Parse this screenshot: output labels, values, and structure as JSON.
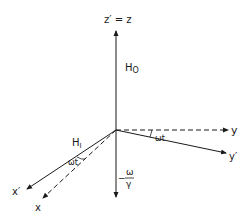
{
  "diagram": {
    "axes": {
      "z": {
        "label": "z′ = z"
      },
      "y": {
        "label": "y"
      },
      "y_prime": {
        "label": "y′"
      },
      "x": {
        "label": "x"
      },
      "x_prime": {
        "label": "x′"
      }
    },
    "fields": {
      "H0": {
        "main": "H",
        "sub": "O"
      },
      "H1": {
        "main": "H",
        "sub": "I"
      }
    },
    "angles": {
      "xy_plane_x": "ωt",
      "xy_plane_y": "ωt"
    },
    "effective_field": {
      "sign": "−",
      "numerator": "ω",
      "denominator": "γ"
    },
    "colors": {
      "ink": "#1a1a1a",
      "background": "#ffffff"
    }
  }
}
